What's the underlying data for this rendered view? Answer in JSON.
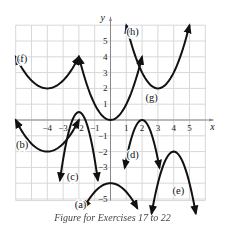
{
  "chart_data": {
    "type": "line",
    "title": "",
    "xlabel": "x",
    "ylabel": "y",
    "xlim": [
      -6,
      6
    ],
    "ylim": [
      -5,
      6
    ],
    "grid": true,
    "x_ticks": [
      "-4",
      "-3",
      "-2",
      "-1",
      "1",
      "2",
      "3",
      "4",
      "5"
    ],
    "y_ticks": [
      "5",
      "4",
      "3",
      "2",
      "1",
      "-1",
      "-2",
      "-3",
      "-5"
    ],
    "series": [
      {
        "name": "(a)",
        "shape": "parabola opening down",
        "vertex": [
          0,
          -4
        ],
        "x_range": [
          -1.7,
          1.7
        ]
      },
      {
        "name": "(b)",
        "shape": "parabola opening up",
        "vertex": [
          -4,
          -2
        ],
        "x_range": [
          -6,
          -2
        ]
      },
      {
        "name": "(c)",
        "shape": "parabola opening down",
        "vertex": [
          -2,
          0.5
        ],
        "x_range": [
          -3.2,
          -0.8
        ]
      },
      {
        "name": "(d)",
        "shape": "parabola opening down",
        "vertex": [
          2,
          0
        ],
        "x_range": [
          0.9,
          3.1
        ]
      },
      {
        "name": "(e)",
        "shape": "parabola opening down",
        "vertex": [
          4,
          -2
        ],
        "x_range": [
          2.6,
          5.4
        ]
      },
      {
        "name": "(f)",
        "shape": "parabola opening up",
        "vertex": [
          -4,
          2
        ],
        "x_range": [
          -6,
          -2
        ]
      },
      {
        "name": "(g)",
        "shape": "parabola opening up",
        "vertex": [
          0,
          0
        ],
        "x_range": [
          -2,
          2
        ]
      },
      {
        "name": "(h)",
        "shape": "parabola opening up",
        "vertex": [
          3,
          2
        ],
        "x_range": [
          1,
          5
        ]
      }
    ],
    "labels": [
      {
        "text": "(a)",
        "x": -1.9,
        "y": -5.6
      },
      {
        "text": "(b)",
        "x": -5.6,
        "y": -1.8
      },
      {
        "text": "(c)",
        "x": -2.4,
        "y": -3.8
      },
      {
        "text": "(d)",
        "x": 1.4,
        "y": -2.4
      },
      {
        "text": "(e)",
        "x": 4.3,
        "y": -4.7
      },
      {
        "text": "(f)",
        "x": -5.6,
        "y": 3.7
      },
      {
        "text": "(g)",
        "x": 2.6,
        "y": 1.2
      },
      {
        "text": "(h)",
        "x": 1.4,
        "y": 5.4
      }
    ]
  },
  "caption": "Figure for Exercises 17 to 22"
}
